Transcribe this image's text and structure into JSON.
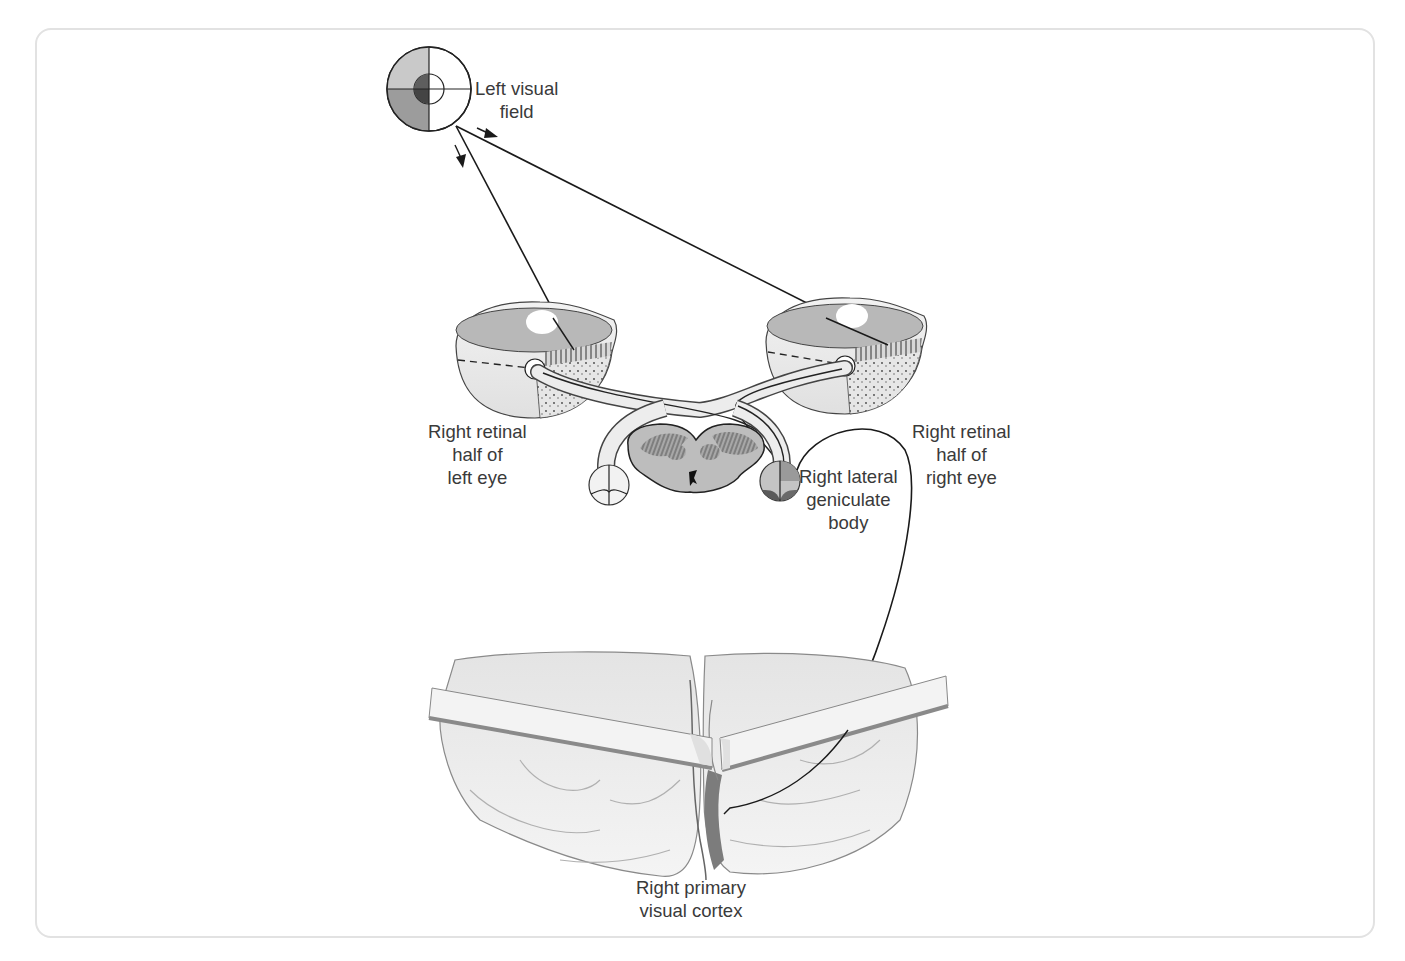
{
  "figure": {
    "colors": {
      "line": "#1a1a1a",
      "label_text": "#3a3a3a",
      "shade_light": "#c8c8c8",
      "shade_medium": "#9a9a9a",
      "shade_dark": "#5a5a5a",
      "frame_border": "#e2e2e2"
    }
  },
  "labels": {
    "left_visual_field": [
      "Left visual",
      "field"
    ],
    "right_retinal_left_eye": [
      "Right retinal",
      "half of",
      "left eye"
    ],
    "right_retinal_right_eye": [
      "Right retinal",
      "half of",
      "right eye"
    ],
    "right_lgn": [
      "Right lateral",
      "geniculate",
      "body"
    ],
    "right_primary_visual_cortex": [
      "Right primary",
      "visual cortex"
    ]
  }
}
